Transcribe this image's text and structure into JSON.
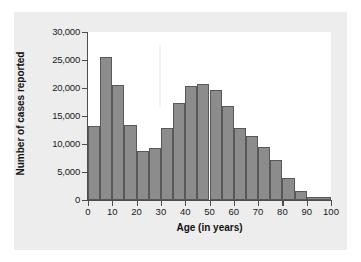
{
  "figure": {
    "panel_bg": "#ededed",
    "plot_bg": "#ffffff",
    "bar_fill": "#8c8c8c",
    "bar_edge": "#58585a",
    "axis_color": "#4c4c4c"
  },
  "chart_data": {
    "type": "bar",
    "title": "",
    "subtitle": "",
    "xlabel": "Age (in years)",
    "ylabel": "Number of cases reported",
    "xlim": [
      0,
      100
    ],
    "ylim": [
      0,
      30000
    ],
    "grid": false,
    "legend": null,
    "bin_width": 5,
    "xticks": [
      0,
      10,
      20,
      30,
      40,
      50,
      60,
      70,
      80,
      90,
      100
    ],
    "xtick_labels": [
      "0",
      "10",
      "20",
      "30",
      "40",
      "50",
      "60",
      "70",
      "80",
      "90",
      "100"
    ],
    "yticks": [
      0,
      5000,
      10000,
      15000,
      20000,
      25000,
      30000
    ],
    "ytick_labels": [
      "0",
      "5,000",
      "10,000",
      "15,000",
      "20,000",
      "25,000",
      "30,000"
    ],
    "bins": [
      {
        "label": "0-5",
        "x0": 0,
        "x1": 5,
        "value": 13300
      },
      {
        "label": "5-10",
        "x0": 5,
        "x1": 10,
        "value": 25500
      },
      {
        "label": "10-15",
        "x0": 10,
        "x1": 15,
        "value": 20600
      },
      {
        "label": "15-20",
        "x0": 15,
        "x1": 20,
        "value": 13400
      },
      {
        "label": "20-25",
        "x0": 20,
        "x1": 25,
        "value": 8700
      },
      {
        "label": "25-30",
        "x0": 25,
        "x1": 30,
        "value": 9200
      },
      {
        "label": "30-35",
        "x0": 30,
        "x1": 35,
        "value": 12900
      },
      {
        "label": "35-40",
        "x0": 35,
        "x1": 40,
        "value": 17400
      },
      {
        "label": "40-45",
        "x0": 40,
        "x1": 45,
        "value": 20400
      },
      {
        "label": "45-50",
        "x0": 45,
        "x1": 50,
        "value": 20700
      },
      {
        "label": "50-55",
        "x0": 50,
        "x1": 55,
        "value": 19600
      },
      {
        "label": "55-60",
        "x0": 55,
        "x1": 60,
        "value": 16800
      },
      {
        "label": "60-65",
        "x0": 60,
        "x1": 65,
        "value": 12900
      },
      {
        "label": "65-70",
        "x0": 65,
        "x1": 70,
        "value": 11500
      },
      {
        "label": "70-75",
        "x0": 70,
        "x1": 75,
        "value": 9400
      },
      {
        "label": "75-80",
        "x0": 75,
        "x1": 80,
        "value": 7200
      },
      {
        "label": "80-85",
        "x0": 80,
        "x1": 85,
        "value": 3900
      },
      {
        "label": "85-90",
        "x0": 85,
        "x1": 90,
        "value": 1650
      },
      {
        "label": "90-100",
        "x0": 90,
        "x1": 100,
        "value": 600
      }
    ]
  }
}
